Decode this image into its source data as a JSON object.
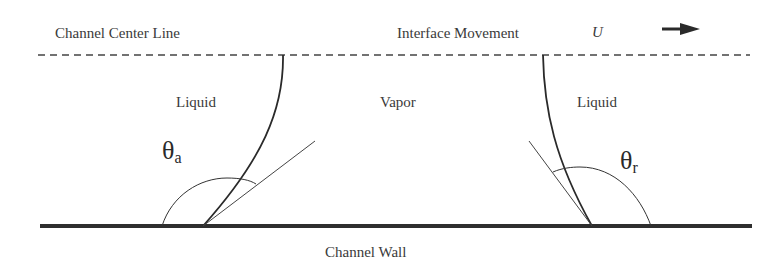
{
  "labels": {
    "center_line": "Channel Center Line",
    "interface_movement": "Interface Movement",
    "velocity_symbol": "U",
    "liquid_left": "Liquid",
    "vapor": "Vapor",
    "liquid_right": "Liquid",
    "wall": "Channel Wall"
  },
  "angles": {
    "advancing": {
      "symbol": "θ",
      "subscript": "a"
    },
    "receding": {
      "symbol": "θ",
      "subscript": "r"
    }
  },
  "colors": {
    "ink": "#333333",
    "wall": "#2e2e2e",
    "background": "#ffffff"
  }
}
